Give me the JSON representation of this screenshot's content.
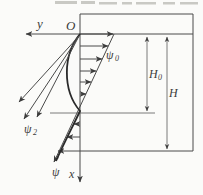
{
  "figure": {
    "colors": {
      "background": "#fbfbf9",
      "line": "#4a4a4a",
      "curve": "#2a2a2a",
      "text": "#3b3b3b",
      "cropped_text_artifact": "#c9c9c4"
    },
    "labels": {
      "y_axis": "y",
      "origin": "O",
      "x_axis": "x",
      "psi0_main": "ψ",
      "psi0_sub": "0",
      "psi2_main": "ψ",
      "psi2_sub": "2",
      "psi_bottom": "ψ",
      "h0_main": "H",
      "h0_sub": "0",
      "h_main": "H"
    }
  }
}
